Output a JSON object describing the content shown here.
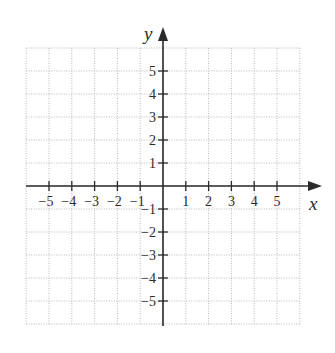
{
  "chart_data": {
    "type": "scatter",
    "title": "",
    "xlabel": "x",
    "ylabel": "y",
    "xlim": [
      -6,
      6
    ],
    "ylim": [
      -6,
      6
    ],
    "grid": true,
    "legend": null,
    "x_ticks": [
      -5,
      -4,
      -3,
      -2,
      -1,
      1,
      2,
      3,
      4,
      5
    ],
    "y_ticks": [
      -5,
      -4,
      -3,
      -2,
      -1,
      1,
      2,
      3,
      4,
      5
    ],
    "x_tick_labels": [
      "−5",
      "−4",
      "−3",
      "−2",
      "−1",
      "1",
      "2",
      "3",
      "4",
      "5"
    ],
    "y_tick_labels": [
      "−5",
      "−4",
      "−3",
      "−2",
      "−1",
      "1",
      "2",
      "3",
      "4",
      "5"
    ],
    "series": []
  },
  "axes": {
    "x_label": "x",
    "y_label": "y"
  },
  "colors": {
    "axis": "#2a2a2a",
    "grid": "#b8b8b8",
    "background": "#ffffff"
  }
}
